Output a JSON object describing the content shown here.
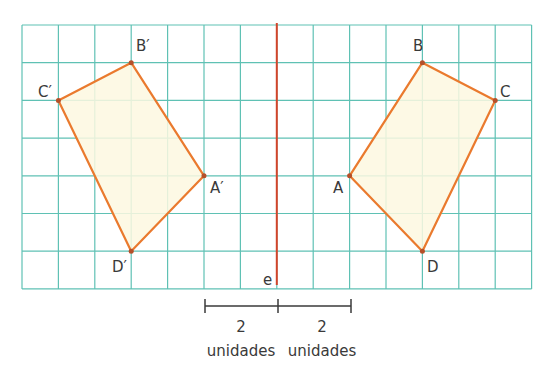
{
  "grid": {
    "cols": 14,
    "rows": 7,
    "x0": 22,
    "y0": 25,
    "cell_w": 36.4,
    "cell_h": 37.7,
    "line_color": "#5fc1b4"
  },
  "axis": {
    "label": "e",
    "col": 7,
    "color": "#d2442a"
  },
  "shape_color": "#ea7a2e",
  "fill_color": "#fdf8e1",
  "original": {
    "A": {
      "label": "A",
      "col": 9,
      "row": 4
    },
    "B": {
      "label": "B",
      "col": 11,
      "row": 1
    },
    "C": {
      "label": "C",
      "col": 13,
      "row": 2
    },
    "D": {
      "label": "D",
      "col": 11,
      "row": 6
    }
  },
  "image": {
    "A": {
      "label": "A′",
      "col": 5,
      "row": 4
    },
    "B": {
      "label": "B′",
      "col": 3,
      "row": 1
    },
    "C": {
      "label": "C′",
      "col": 1,
      "row": 2
    },
    "D": {
      "label": "D′",
      "col": 3,
      "row": 6
    }
  },
  "scale": {
    "left": {
      "value": "2",
      "unit": "unidades"
    },
    "right": {
      "value": "2",
      "unit": "unidades"
    }
  }
}
